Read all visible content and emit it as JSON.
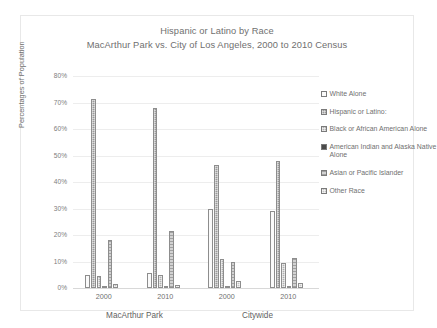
{
  "chart_data": {
    "type": "bar",
    "title": "Hispanic or Latino by Race",
    "subtitle": "MacArthur Park vs. City of Los Angeles, 2000 to 2010 Census",
    "xlabel": "",
    "ylabel": "Percentages of Population",
    "ylim": [
      0,
      80
    ],
    "ytick_labels": [
      "0%",
      "10%",
      "20%",
      "30%",
      "40%",
      "50%",
      "60%",
      "70%",
      "80%"
    ],
    "ytick_values": [
      0,
      10,
      20,
      30,
      40,
      50,
      60,
      70,
      80
    ],
    "grid": true,
    "legend_position": "right",
    "categories": [
      "2000",
      "2010",
      "2000",
      "2010"
    ],
    "group_labels": [
      "MacArthur Park",
      "Citywide"
    ],
    "group_spans": [
      2,
      2
    ],
    "series": [
      {
        "name": "White Alone",
        "pattern": "p-white",
        "values": [
          5.0,
          5.5,
          29.8,
          29.0
        ]
      },
      {
        "name": "Hispanic or Latino:",
        "pattern": "p-hisp",
        "values": [
          71.5,
          68.0,
          46.5,
          48.0
        ]
      },
      {
        "name": "Black or African American Alone",
        "pattern": "p-black",
        "values": [
          4.5,
          4.8,
          11.0,
          9.5
        ]
      },
      {
        "name": "American Indian and Alaska Native Alone",
        "pattern": "p-amind",
        "values": [
          0.3,
          0.3,
          0.3,
          0.3
        ]
      },
      {
        "name": "Asian or Pacific Islander",
        "pattern": "p-asian",
        "values": [
          18.0,
          21.5,
          10.0,
          11.3
        ]
      },
      {
        "name": "Other Race",
        "pattern": "p-other",
        "values": [
          1.5,
          1.0,
          2.8,
          2.0
        ]
      }
    ]
  },
  "legend": {
    "items": [
      {
        "label": "White Alone"
      },
      {
        "label": "Hispanic or Latino:"
      },
      {
        "label": "Black or African American Alone"
      },
      {
        "label": "American Indian and Alaska Native Alone"
      },
      {
        "label": "Asian or Pacific Islander"
      },
      {
        "label": "Other Race"
      }
    ]
  },
  "colors": {
    "text": "#6f6f6f",
    "grid": "#ededed",
    "frame": "#e8e8e8",
    "bar_outline": "#8d8d8d"
  }
}
